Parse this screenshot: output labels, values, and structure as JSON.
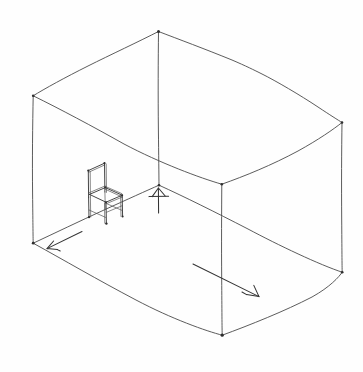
{
  "canvas": {
    "title": "Hand-drawn perspective sketch of a room interior with a single chair",
    "width": 363,
    "height": 372,
    "background_color": "#fefefe",
    "ink_color": "#4a4a4a",
    "chair_ink_color": "#3c3c3c",
    "arrow_ink_color": "#333333",
    "medium": "pencil-line-drawing"
  },
  "scene": {
    "subject": "empty room interior",
    "style": "freehand two-point perspective line sketch",
    "objects": [
      {
        "name": "room-box",
        "label": "rectangular room volume"
      },
      {
        "name": "chair",
        "label": "wooden chair with tall slat back"
      },
      {
        "name": "floor-arrows",
        "label": "three directional arrows indicating axes"
      }
    ]
  },
  "room": {
    "vertices": {
      "ceiling_back_apex": [
        158,
        31
      ],
      "ceiling_left": [
        33,
        96
      ],
      "ceiling_right": [
        342,
        122
      ],
      "ceiling_front": [
        222,
        184
      ],
      "floor_back": [
        159,
        185
      ],
      "floor_left": [
        33,
        243
      ],
      "floor_right": [
        342,
        272
      ],
      "floor_front": [
        222,
        335
      ]
    },
    "edges": [
      "ceiling-back-left",
      "ceiling-back-right",
      "ceiling-front-left",
      "ceiling-front-right",
      "vertical-back-corner",
      "vertical-left-corner",
      "vertical-right-corner",
      "vertical-front-corner",
      "floor-back-left",
      "floor-back-right",
      "floor-front-left",
      "floor-front-right"
    ]
  },
  "chair": {
    "position": "left wall, floor level, facing right",
    "parts": [
      "back-rest",
      "back-posts",
      "seat",
      "front-legs",
      "back-legs",
      "side-rails",
      "stretchers"
    ],
    "bounds": [
      86,
      160,
      54,
      58
    ]
  },
  "arrows": {
    "items": [
      {
        "name": "arrow-left-depth",
        "direction": "down-left",
        "tip": [
          46,
          249
        ],
        "tail": [
          82,
          232
        ]
      },
      {
        "name": "arrow-center-up",
        "direction": "up",
        "tip": [
          158,
          188
        ],
        "tail": [
          158,
          212
        ]
      },
      {
        "name": "arrow-right-width",
        "direction": "down-right",
        "tip": [
          259,
          297
        ],
        "tail": [
          215,
          275
        ]
      }
    ]
  }
}
